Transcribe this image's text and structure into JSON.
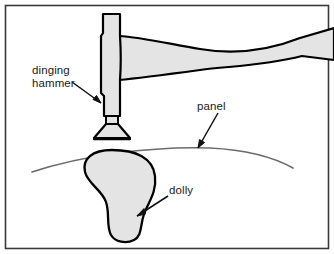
{
  "figure": {
    "border_color": "#3a3a3a",
    "metal_fill": "#e4e4e4",
    "outline_color": "#000000",
    "panel_line_color": "#6b6b6b",
    "label_color": "#1a1a1a",
    "background": "#ffffff"
  },
  "labels": {
    "hammer_line1": "dinging",
    "hammer_line2": "hammer",
    "panel": "panel",
    "dolly": "dolly"
  },
  "parts": {
    "hammer_head": "hammer-head",
    "hammer_face": "hammer-face",
    "hammer_handle": "hammer-handle",
    "panel": "panel-sheet",
    "dolly": "dolly-block"
  },
  "leaders": {
    "hammer_arrow": "arrow pointing down-right to hammer shaft",
    "panel_arrow": "arrow pointing down-left to panel line",
    "dolly_arrow": "arrow pointing down-left to dolly body"
  }
}
